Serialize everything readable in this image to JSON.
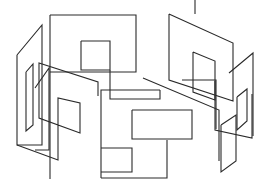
{
  "figure": {
    "title": "",
    "width": 268,
    "height": 179,
    "background": "#ffffff",
    "stroke_color": "#2a2a2a",
    "stroke_width": 1.1,
    "paths": [
      {
        "name": "back-frame-top",
        "points": "50,15 136,15 136,72 50,72"
      },
      {
        "name": "back-frame-left",
        "points": "50,15 50,179"
      },
      {
        "name": "back-inner-square",
        "points": "81,41 110,41 110,70 81,70 81,41"
      },
      {
        "name": "back-frame-drop",
        "points": "110,70 110,99 160,99 160,90"
      },
      {
        "name": "center-big-loop",
        "points": "101,178 101,90 160,90"
      },
      {
        "name": "center-lower-square",
        "points": "101,148 132,148 132,172 101,172"
      },
      {
        "name": "center-front-square",
        "points": "132,110 192,110 192,139 132,139 132,110"
      },
      {
        "name": "center-spine",
        "points": "101,178 167,178 167,140"
      },
      {
        "name": "left-outer-panel",
        "points": "17,55 42,25 42,145 17,145 17,55"
      },
      {
        "name": "left-outer-panel-2",
        "points": "17,145 58,160 58,98 80,103 80,133 39,118 39,63 98,82 98,96"
      },
      {
        "name": "left-small-panel",
        "points": "26,72 33,64 33,125 26,131 26,72"
      },
      {
        "name": "left-mid-panel",
        "points": "35,88 49,68 49,150 35,150"
      },
      {
        "name": "right-big-panel",
        "points": "169,14 233,43 233,101 169,80 169,14"
      },
      {
        "name": "right-inner-panel",
        "points": "193,52 215,61 215,100 193,92 193,52"
      },
      {
        "name": "right-upright-1",
        "points": "215,81 215,130 252,138 252,94"
      },
      {
        "name": "right-upright-2",
        "points": "229,73 253,53 253,136"
      },
      {
        "name": "right-small-panel",
        "points": "237,97 247,89 247,121 237,130 237,97"
      },
      {
        "name": "right-front-panel",
        "points": "221,125 236,115 236,161 221,172 221,125"
      },
      {
        "name": "right-connector",
        "points": "182,80 216,80 216,129"
      },
      {
        "name": "right-back-left",
        "points": "195,0 195,14"
      },
      {
        "name": "right-diagonal",
        "points": "143,78 219,110 219,161"
      }
    ]
  }
}
